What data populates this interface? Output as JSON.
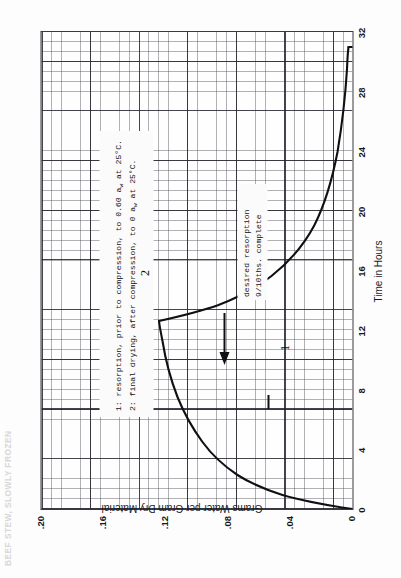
{
  "title": "BEEF STEW, SLOWLY FROZEN",
  "axes": {
    "xlabel": "Time in Hours",
    "ylabel": "Grams Water per Gram Dry Material",
    "xticks": [
      "0",
      "4",
      "8",
      "12",
      "16",
      "20",
      "24",
      "28",
      "32"
    ],
    "yticks": [
      ".20",
      ".16",
      ".12",
      ".08",
      ".04",
      "0"
    ]
  },
  "legend_note": {
    "line1_pre": "1: resorption, prior to compression, to 0.60 a",
    "line1_sub": "w",
    "line1_post": " at 25°C.",
    "line2_pre": "2: final drying, after compression, to 0 a",
    "line2_sub": "w",
    "line2_post": " at 25°C."
  },
  "callout": {
    "line1": "desired resorption",
    "line2": "9/10ths. complete"
  },
  "curve_labels": {
    "one": "1",
    "two": "2"
  },
  "colors": {
    "ink": "#101014",
    "grid_major": "#23232d",
    "grid_minor": "#464650",
    "paper": "#fdfdfd"
  },
  "chart_data": {
    "type": "line",
    "title": "BEEF STEW, SLOWLY FROZEN",
    "xlabel": "Time in Hours",
    "ylabel": "Grams Water per Gram Dry Material",
    "xlim": [
      0,
      32
    ],
    "ylim": [
      0,
      0.2
    ],
    "xticks": [
      0,
      4,
      8,
      12,
      16,
      20,
      24,
      28,
      32
    ],
    "yticks": [
      0,
      0.04,
      0.08,
      0.12,
      0.16,
      0.2
    ],
    "grid": true,
    "legend": "none",
    "annotations": [
      {
        "text": "1: resorption, prior to compression, to 0.60 aw at 25°C.",
        "x": 4.5,
        "y": 0.182
      },
      {
        "text": "2: final drying, after compression, to 0 aw at 25°C.",
        "x": 4.5,
        "y": 0.17
      },
      {
        "text": "desired resorption 9/10ths. complete",
        "x": 10.5,
        "y": 0.082,
        "arrow_to_x": 6.6,
        "arrow_to_y": 0.083
      }
    ],
    "series": [
      {
        "name": "1: resorption, prior to compression, to 0.60 aw at 25°C.",
        "label": "1",
        "x": [
          0,
          0.4,
          0.8,
          1.2,
          1.6,
          2.0,
          2.6,
          3.2,
          4.0,
          5.0,
          6.0,
          7.0,
          8.0,
          9.0,
          10.0,
          11.0,
          12.0,
          12.6
        ],
        "y": [
          0.0,
          0.018,
          0.034,
          0.048,
          0.058,
          0.066,
          0.076,
          0.084,
          0.092,
          0.1,
          0.105,
          0.109,
          0.112,
          0.1145,
          0.1162,
          0.1175,
          0.1185,
          0.119
        ]
      },
      {
        "name": "2: final drying, after compression, to 0 aw at 25°C.",
        "label": "2",
        "x": [
          12.6,
          13.0,
          13.6,
          14.4,
          15.4,
          16.6,
          18.0,
          19.5,
          21.0,
          23.0,
          25.0,
          27.0,
          29.0,
          30.4,
          31.0
        ],
        "y": [
          0.119,
          0.104,
          0.09,
          0.076,
          0.064,
          0.053,
          0.043,
          0.035,
          0.03,
          0.024,
          0.02,
          0.017,
          0.0145,
          0.013,
          0.0125
        ]
      },
      {
        "name": "final drying vertical drop to zero",
        "label": "",
        "x": [
          31.0,
          31.0
        ],
        "y": [
          0.0125,
          0.0
        ]
      }
    ]
  }
}
